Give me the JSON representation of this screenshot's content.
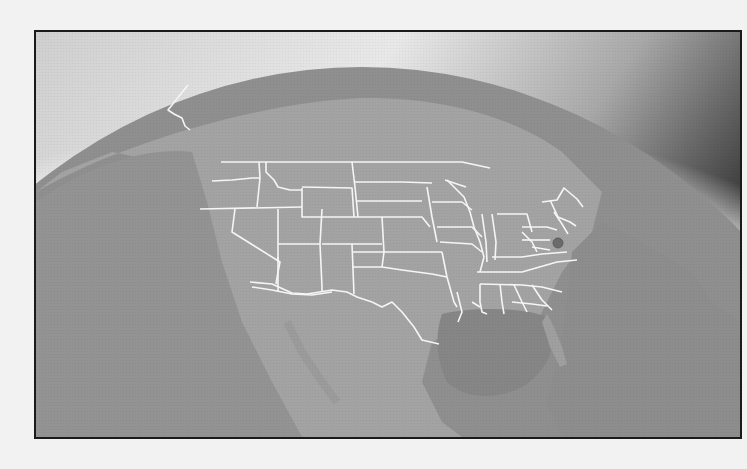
{
  "figure": {
    "colors": {
      "page_background": "#f2f2f2",
      "frame_border": "#1a1a1a",
      "space_light": "#e0e0e0",
      "space_dark": "#4a4a4a",
      "land": "#a2a2a2",
      "ocean": "#8e8e8e",
      "gulf": "#858585",
      "borders": "#f4f4f4",
      "marker": "#6a6a6a"
    },
    "marker": {
      "label": "marker-dot",
      "x": 556,
      "y": 241
    }
  }
}
